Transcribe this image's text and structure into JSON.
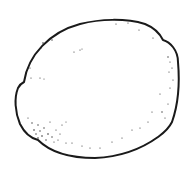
{
  "image": {
    "subject": "lemon",
    "style": "black ink line drawing with stippled shading",
    "background_color": "#ffffff",
    "stroke_color": "#1a1a1a",
    "stipple_color": "#333333"
  }
}
